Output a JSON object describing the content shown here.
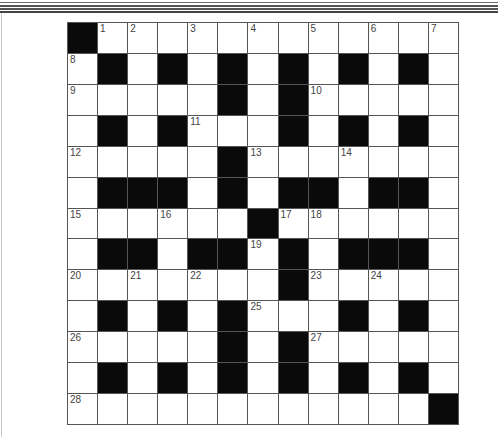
{
  "puzzle": {
    "rows": 13,
    "cols": 13,
    "colors": {
      "block": "#0a0a0a",
      "cell": "#ffffff",
      "gridline": "#555555",
      "number": "#444444"
    },
    "grid": [
      [
        "#",
        "1",
        "2",
        "",
        "3",
        "",
        "4",
        "",
        "5",
        "",
        "6",
        "",
        "7"
      ],
      [
        "8",
        "#",
        "",
        "#",
        "",
        "#",
        "",
        "#",
        "",
        "#",
        "",
        "#",
        ""
      ],
      [
        "9",
        "",
        "",
        "",
        "",
        "#",
        "",
        "#",
        "10",
        "",
        "",
        "",
        ""
      ],
      [
        "",
        "#",
        "",
        "#",
        "11",
        "",
        "",
        "#",
        "",
        "#",
        "",
        "#",
        ""
      ],
      [
        "12",
        "",
        "",
        "",
        "",
        "#",
        "13",
        "",
        "",
        "14",
        "",
        "",
        ""
      ],
      [
        "",
        "#",
        "#",
        "#",
        "",
        "#",
        "",
        "#",
        "#",
        "",
        "#",
        "#",
        ""
      ],
      [
        "15",
        "",
        "",
        "16",
        "",
        "",
        "#",
        "17",
        "18",
        "",
        "",
        "",
        ""
      ],
      [
        "",
        "#",
        "#",
        "",
        "#",
        "#",
        "19",
        "#",
        "",
        "#",
        "#",
        "#",
        ""
      ],
      [
        "20",
        "",
        "21",
        "",
        "22",
        "",
        "",
        "#",
        "23",
        "",
        "24",
        "",
        ""
      ],
      [
        "",
        "#",
        "",
        "#",
        "",
        "#",
        "25",
        "",
        "",
        "#",
        "",
        "#",
        ""
      ],
      [
        "26",
        "",
        "",
        "",
        "",
        "#",
        "",
        "#",
        "27",
        "",
        "",
        "",
        ""
      ],
      [
        "",
        "#",
        "",
        "#",
        "",
        "#",
        "",
        "#",
        "",
        "#",
        "",
        "#",
        ""
      ],
      [
        "28",
        "",
        "",
        "",
        "",
        "",
        "",
        "",
        "",
        "",
        "",
        "",
        "#"
      ]
    ],
    "clue_numbers": [
      "1",
      "2",
      "3",
      "4",
      "5",
      "6",
      "7",
      "8",
      "9",
      "10",
      "11",
      "12",
      "13",
      "14",
      "15",
      "16",
      "17",
      "18",
      "19",
      "20",
      "21",
      "22",
      "23",
      "24",
      "25",
      "26",
      "27",
      "28"
    ]
  }
}
